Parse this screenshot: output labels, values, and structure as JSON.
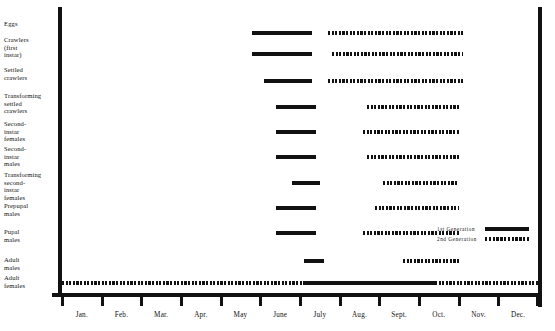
{
  "chart_data": {
    "type": "bar",
    "title": "",
    "subtitle": "",
    "xlabel": "",
    "ylabel": "",
    "grid": false,
    "legend_position": "bottom-right",
    "x_axis": {
      "tick_labels": [
        "Jan.",
        "Feb.",
        "Mar.",
        "Apr.",
        "May",
        "June",
        "July",
        "Aug.",
        "Sept.",
        "Oct.",
        "Nov.",
        "Dec."
      ],
      "range": [
        "Jan.",
        "Dec."
      ]
    },
    "y_axis": {
      "tick_labels": [
        "Eggs",
        "Crawlers (first instar)",
        "Settled crawlers",
        "Transforming settled crawlers",
        "Second-instar females",
        "Second-instar males",
        "Transforming second-instar females",
        "Prepupal males",
        "Pupal males",
        "Adult males",
        "Adult females"
      ]
    },
    "series": [
      {
        "name": "1st Generation",
        "style": "solid",
        "spans": [
          {
            "stage": "Eggs",
            "start_month": 4.8,
            "end_month": 6.3
          },
          {
            "stage": "Crawlers (first instar)",
            "start_month": 4.8,
            "end_month": 6.3
          },
          {
            "stage": "Settled crawlers",
            "start_month": 5.1,
            "end_month": 6.3
          },
          {
            "stage": "Transforming settled crawlers",
            "start_month": 5.4,
            "end_month": 6.4
          },
          {
            "stage": "Second-instar females",
            "start_month": 5.4,
            "end_month": 6.4
          },
          {
            "stage": "Second-instar males",
            "start_month": 5.4,
            "end_month": 6.4
          },
          {
            "stage": "Transforming second-instar females",
            "start_month": 5.8,
            "end_month": 6.5
          },
          {
            "stage": "Prepupal males",
            "start_month": 5.4,
            "end_month": 6.4
          },
          {
            "stage": "Pupal males",
            "start_month": 5.4,
            "end_month": 6.4
          },
          {
            "stage": "Adult males",
            "start_month": 6.1,
            "end_month": 6.6
          },
          {
            "stage": "Adult females",
            "start_month": 6.1,
            "end_month": 9.4
          }
        ]
      },
      {
        "name": "2nd Generation",
        "style": "dashed",
        "spans": [
          {
            "stage": "Eggs",
            "start_month": 6.7,
            "end_month": 10.1
          },
          {
            "stage": "Crawlers (first instar)",
            "start_month": 6.8,
            "end_month": 10.1
          },
          {
            "stage": "Settled crawlers",
            "start_month": 6.7,
            "end_month": 10.1
          },
          {
            "stage": "Transforming settled crawlers",
            "start_month": 7.7,
            "end_month": 10.0
          },
          {
            "stage": "Second-instar females",
            "start_month": 7.6,
            "end_month": 10.0
          },
          {
            "stage": "Second-instar males",
            "start_month": 7.7,
            "end_month": 10.0
          },
          {
            "stage": "Transforming second-instar females",
            "start_month": 8.1,
            "end_month": 10.0
          },
          {
            "stage": "Prepupal males",
            "start_month": 7.9,
            "end_month": 10.0
          },
          {
            "stage": "Pupal males",
            "start_month": 7.6,
            "end_month": 10.0
          },
          {
            "stage": "Adult males",
            "start_month": 8.6,
            "end_month": 10.0
          },
          {
            "stage": "Adult females",
            "start_month": 0.0,
            "end_month": 6.1
          },
          {
            "stage": "Adult females",
            "start_month": 9.4,
            "end_month": 12.0
          }
        ]
      }
    ],
    "legend": [
      {
        "label": "1st Generation",
        "style": "solid"
      },
      {
        "label": "2nd Generation",
        "style": "dashed"
      }
    ]
  },
  "axis": {
    "months": [
      {
        "label": "Jan."
      },
      {
        "label": "Feb."
      },
      {
        "label": "Mar."
      },
      {
        "label": "Apr."
      },
      {
        "label": "May"
      },
      {
        "label": "June"
      },
      {
        "label": "July"
      },
      {
        "label": "Aug."
      },
      {
        "label": "Sept."
      },
      {
        "label": "Oct."
      },
      {
        "label": "Nov."
      },
      {
        "label": "Dec."
      }
    ]
  },
  "stages": [
    {
      "label": "Eggs",
      "top": 20
    },
    {
      "label": "Crawlers\n(first\ninstar)",
      "top": 36
    },
    {
      "label": "Settled\ncrawlers",
      "top": 66
    },
    {
      "label": "Transforming\nsettled\ncrawlers",
      "top": 92
    },
    {
      "label": "Second-\ninstar\nfemales",
      "top": 120
    },
    {
      "label": "Second-\ninstar\nmales",
      "top": 145
    },
    {
      "label": "Transforming\nsecond-\ninstar\nfemales",
      "top": 171
    },
    {
      "label": "Prepupal\nmales",
      "top": 202
    },
    {
      "label": "Pupal\nmales",
      "top": 228
    },
    {
      "label": "Adult\nmales",
      "top": 256
    },
    {
      "label": "Adult\nfemales",
      "top": 274
    }
  ],
  "legend": {
    "gen1_label": "1st Generation",
    "gen2_label": "2nd Generation"
  },
  "colors": {
    "ink": "#111111",
    "background": "#ffffff"
  }
}
